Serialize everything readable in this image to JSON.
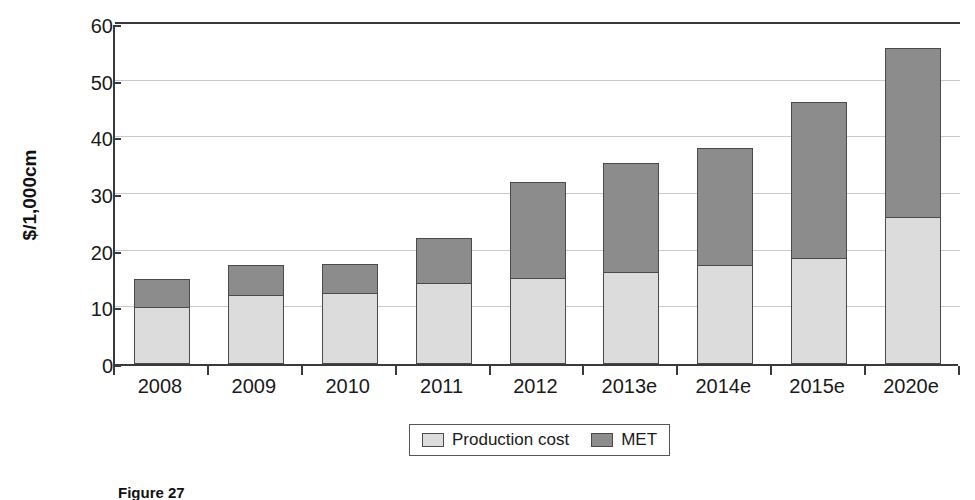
{
  "chart_data": {
    "type": "bar",
    "subtype": "stacked",
    "title": "",
    "xlabel": "",
    "ylabel": "$/1,000cm",
    "ylim": [
      0,
      60
    ],
    "yticks": [
      0,
      10,
      20,
      30,
      40,
      50,
      60
    ],
    "grid": true,
    "legend_position": "bottom",
    "categories": [
      "2008",
      "2009",
      "2010",
      "2011",
      "2012",
      "2013e",
      "2014e",
      "2015e",
      "2020e"
    ],
    "series": [
      {
        "name": "Production cost",
        "color": "#dcdcdc",
        "values": [
          10.2,
          12.3,
          12.6,
          14.3,
          15.3,
          16.4,
          17.6,
          18.8,
          26.0
        ]
      },
      {
        "name": "MET",
        "color": "#8c8c8c",
        "values": [
          4.8,
          5.1,
          5.0,
          7.9,
          16.9,
          19.1,
          20.6,
          27.5,
          29.7
        ]
      }
    ],
    "totals": [
      15.0,
      17.4,
      17.6,
      22.2,
      32.2,
      35.5,
      38.2,
      46.3,
      55.7
    ]
  },
  "axis": {
    "y_title": "$/1,000cm",
    "y_tick_labels": [
      "0",
      "10",
      "20",
      "30",
      "40",
      "50",
      "60"
    ],
    "x_tick_labels": [
      "2008",
      "2009",
      "2010",
      "2011",
      "2012",
      "2013e",
      "2014e",
      "2015e",
      "2020e"
    ]
  },
  "legend": {
    "items": [
      {
        "label": "Production cost",
        "color": "#dcdcdc"
      },
      {
        "label": "MET",
        "color": "#8c8c8c"
      }
    ]
  },
  "caption": {
    "text": "Figure 27"
  }
}
